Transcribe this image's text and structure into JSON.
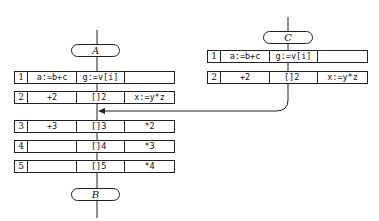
{
  "left_flowchart": {
    "start_label": "A",
    "end_label": "B",
    "rows": [
      {
        "num": "1",
        "col1": "a:=b+c",
        "col2": "g:=v[i]",
        "col3": ""
      },
      {
        "num": "2",
        "col1": "+2",
        "col2": "[]2",
        "col3": "x:=y*z"
      },
      {
        "num": "3",
        "col1": "+3",
        "col2": "[]3",
        "col3": "*2"
      },
      {
        "num": "4",
        "col1": "",
        "col2": "[]4",
        "col3": "*3"
      },
      {
        "num": "5",
        "col1": "",
        "col2": "[]5",
        "col3": "*4"
      }
    ]
  },
  "right_flowchart": {
    "start_label": "C",
    "rows": [
      {
        "num": "1",
        "col1": "a:=b+c",
        "col2": "g:=v[i]",
        "col3": ""
      },
      {
        "num": "2",
        "col1": "+2",
        "col2": "[]2",
        "col3": "x:=y*z"
      }
    ]
  },
  "connection": {
    "from": "C flow after row 2",
    "to": "A flow between row 2 and row 3"
  }
}
